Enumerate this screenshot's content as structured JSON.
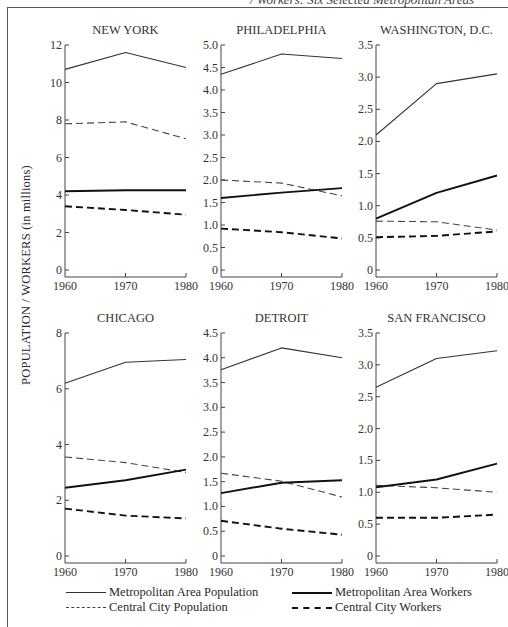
{
  "caption": "/ Workers: Six Selected Metropolitan Areas",
  "y_axis_label": "POPULATION / WORKERS (in millions)",
  "legend": {
    "metro_pop": "Metropolitan Area Population",
    "metro_workers": "Metropolitan Area Workers",
    "city_pop": "Central City Population",
    "city_workers": "Central City Workers"
  },
  "chart_data": [
    {
      "type": "line",
      "title": "NEW YORK",
      "x": [
        1960,
        1970,
        1980
      ],
      "ylim": [
        0,
        12
      ],
      "yticks": [
        0,
        2,
        4,
        6,
        8,
        10,
        12
      ],
      "ytick_labels": [
        "0",
        "2",
        "4",
        "6",
        "8",
        "10",
        "12"
      ],
      "ylabel": "POPULATION / WORKERS (in millions)",
      "series": [
        {
          "name": "Metropolitan Area Population",
          "values": [
            10.7,
            11.6,
            10.8
          ]
        },
        {
          "name": "Central City Population",
          "values": [
            7.8,
            7.9,
            7.0
          ]
        },
        {
          "name": "Metropolitan Area Workers",
          "values": [
            4.2,
            4.25,
            4.25
          ]
        },
        {
          "name": "Central City Workers",
          "values": [
            3.4,
            3.2,
            2.95
          ]
        }
      ]
    },
    {
      "type": "line",
      "title": "PHILADELPHIA",
      "x": [
        1960,
        1970,
        1980
      ],
      "ylim": [
        0,
        5.0
      ],
      "yticks": [
        0,
        0.5,
        1.0,
        1.5,
        2.0,
        2.5,
        3.0,
        3.5,
        4.0,
        4.5,
        5.0
      ],
      "ytick_labels": [
        "0",
        "0.5",
        "1.0",
        "1.5",
        "2.0",
        "2.5",
        "3.0",
        "3.5",
        "4.0",
        "4.5",
        "5.0"
      ],
      "series": [
        {
          "name": "Metropolitan Area Population",
          "values": [
            4.35,
            4.8,
            4.7
          ]
        },
        {
          "name": "Central City Population",
          "values": [
            2.0,
            1.93,
            1.65
          ]
        },
        {
          "name": "Metropolitan Area Workers",
          "values": [
            1.6,
            1.72,
            1.82
          ]
        },
        {
          "name": "Central City Workers",
          "values": [
            0.92,
            0.84,
            0.7
          ]
        }
      ]
    },
    {
      "type": "line",
      "title": "WASHINGTON, D.C.",
      "x": [
        1960,
        1970,
        1980
      ],
      "ylim": [
        0,
        3.5
      ],
      "yticks": [
        0,
        0.5,
        1.0,
        1.5,
        2.0,
        2.5,
        3.0,
        3.5
      ],
      "ytick_labels": [
        "0",
        "0.5",
        "1.0",
        "1.5",
        "2.0",
        "2.5",
        "3.0",
        "3.5"
      ],
      "series": [
        {
          "name": "Metropolitan Area Population",
          "values": [
            2.1,
            2.9,
            3.05
          ]
        },
        {
          "name": "Central City Population",
          "values": [
            0.76,
            0.75,
            0.62
          ]
        },
        {
          "name": "Metropolitan Area Workers",
          "values": [
            0.8,
            1.2,
            1.47
          ]
        },
        {
          "name": "Central City Workers",
          "values": [
            0.51,
            0.53,
            0.6
          ]
        }
      ]
    },
    {
      "type": "line",
      "title": "CHICAGO",
      "x": [
        1960,
        1970,
        1980
      ],
      "ylim": [
        0,
        8
      ],
      "yticks": [
        0,
        2,
        4,
        6,
        8
      ],
      "ytick_labels": [
        "0",
        "2",
        "4",
        "6",
        "8"
      ],
      "series": [
        {
          "name": "Metropolitan Area Population",
          "values": [
            6.2,
            6.95,
            7.05
          ]
        },
        {
          "name": "Central City Population",
          "values": [
            3.55,
            3.35,
            3.0
          ]
        },
        {
          "name": "Metropolitan Area Workers",
          "values": [
            2.45,
            2.72,
            3.1
          ]
        },
        {
          "name": "Central City Workers",
          "values": [
            1.7,
            1.45,
            1.35
          ]
        }
      ]
    },
    {
      "type": "line",
      "title": "DETROIT",
      "x": [
        1960,
        1970,
        1980
      ],
      "ylim": [
        0,
        4.5
      ],
      "yticks": [
        0,
        0.5,
        1.0,
        1.5,
        2.0,
        2.5,
        3.0,
        3.5,
        4.0,
        4.5
      ],
      "ytick_labels": [
        "0",
        "0.5",
        "1.0",
        "1.5",
        "2.0",
        "2.5",
        "3.0",
        "3.5",
        "4.0",
        "4.5"
      ],
      "series": [
        {
          "name": "Metropolitan Area Population",
          "values": [
            3.76,
            4.2,
            4.0
          ]
        },
        {
          "name": "Central City Population",
          "values": [
            1.67,
            1.51,
            1.19
          ]
        },
        {
          "name": "Metropolitan Area Workers",
          "values": [
            1.27,
            1.48,
            1.53
          ]
        },
        {
          "name": "Central City Workers",
          "values": [
            0.71,
            0.55,
            0.43
          ]
        }
      ]
    },
    {
      "type": "line",
      "title": "SAN FRANCISCO",
      "x": [
        1960,
        1970,
        1980
      ],
      "ylim": [
        0,
        3.5
      ],
      "yticks": [
        0,
        0.5,
        1.0,
        1.5,
        2.0,
        2.5,
        3.0,
        3.5
      ],
      "ytick_labels": [
        "0",
        "0.5",
        "1.0",
        "1.5",
        "2.0",
        "2.5",
        "3.0",
        "3.5"
      ],
      "series": [
        {
          "name": "Metropolitan Area Population",
          "values": [
            2.65,
            3.1,
            3.22
          ]
        },
        {
          "name": "Central City Population",
          "values": [
            1.11,
            1.07,
            1.0
          ]
        },
        {
          "name": "Metropolitan Area Workers",
          "values": [
            1.08,
            1.2,
            1.45
          ]
        },
        {
          "name": "Central City Workers",
          "values": [
            0.6,
            0.6,
            0.65
          ]
        }
      ]
    }
  ],
  "x_tick_labels": [
    "1960",
    "1970",
    "1980"
  ],
  "legend_position": "bottom",
  "grid": false
}
